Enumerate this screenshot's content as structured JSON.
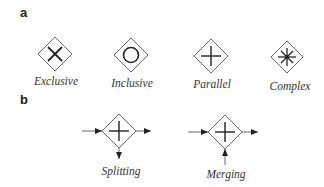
{
  "panels": {
    "a": {
      "label": "a",
      "gateways": [
        {
          "name": "Exclusive",
          "symbol": "x-cross",
          "cx": 55,
          "cy": 54
        },
        {
          "name": "Inclusive",
          "symbol": "circle",
          "cx": 131,
          "cy": 55
        },
        {
          "name": "Parallel",
          "symbol": "plus",
          "cx": 211,
          "cy": 56
        },
        {
          "name": "Complex",
          "symbol": "asterisk",
          "cx": 287,
          "cy": 57
        }
      ]
    },
    "b": {
      "label": "b",
      "gateways": [
        {
          "name": "Splitting",
          "symbol": "plus",
          "cx": 119,
          "cy": 131,
          "flows": "1 in (left), 2 out (right, down)"
        },
        {
          "name": "Merging",
          "symbol": "plus",
          "cx": 225,
          "cy": 132,
          "flows": "2 in (left, bottom), 1 out (right)"
        }
      ]
    }
  },
  "colors": {
    "stroke": "#555555",
    "symbol": "#222222",
    "text": "#333333",
    "background": "#ffffff"
  }
}
